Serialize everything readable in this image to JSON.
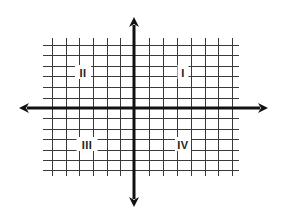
{
  "diagram": {
    "title": "",
    "type": "coordinate-plane",
    "colors": {
      "background": "#ffffff",
      "grid": "#3a3a3a",
      "axis": "#111111",
      "label": "#222222"
    },
    "grid": {
      "x_min": 43,
      "x_max": 239,
      "y_min": 38,
      "y_max": 176,
      "vertical_lines_x": [
        52,
        66,
        79,
        93,
        107,
        120,
        149,
        163,
        177,
        191,
        205,
        218,
        232
      ],
      "horizontal_lines_y": [
        45,
        55,
        66,
        76,
        87,
        98,
        118,
        129,
        139,
        150,
        160,
        170
      ]
    },
    "axes": {
      "x_axis": {
        "y": 108,
        "x_start": 19,
        "x_end": 268,
        "arrows": [
          "left",
          "right"
        ]
      },
      "y_axis": {
        "x": 134,
        "y_start": 17,
        "y_end": 207,
        "arrows": [
          "up",
          "down"
        ]
      }
    },
    "quadrants": [
      {
        "id": "quadrant-1",
        "label": "I",
        "x": 183,
        "y": 72
      },
      {
        "id": "quadrant-2",
        "label": "II",
        "x": 83,
        "y": 72
      },
      {
        "id": "quadrant-3",
        "label": "III",
        "x": 87,
        "y": 144
      },
      {
        "id": "quadrant-4",
        "label": "IV",
        "x": 183,
        "y": 144
      }
    ]
  }
}
